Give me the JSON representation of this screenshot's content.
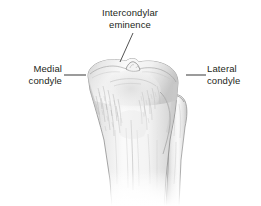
{
  "figure": {
    "background_color": "#ffffff",
    "width": 261,
    "height": 206
  },
  "labels": {
    "intercondylar_eminence": "Intercondylar\neminence",
    "medial_condyle": "Medial\ncondyle",
    "lateral_condyle": "Lateral\ncondyle"
  },
  "leader_lines": {
    "intercondylar": {
      "x1": 133,
      "y1": 33,
      "x2": 120,
      "y2": 62,
      "color": "#3f3f3f"
    },
    "medial": {
      "x1": 64,
      "y1": 75,
      "x2": 86,
      "y2": 75,
      "color": "#4a4a4a"
    },
    "lateral": {
      "x1": 186,
      "y1": 75,
      "x2": 206,
      "y2": 75,
      "color": "#4a4a4a"
    }
  },
  "colors": {
    "bone_fill_light": "#fbfbfb",
    "bone_fill_mid": "#ededed",
    "bone_fill_shadow": "#d2d2d2",
    "bone_outline": "#8a8a8a",
    "bone_outline_dark": "#6e6e6e",
    "texture_line": "#b4b4b4",
    "text": "#231f20"
  },
  "structures": [
    {
      "name": "tibial-plateau",
      "description": "Broad superior articular surface of the tibia"
    },
    {
      "name": "intercondylar-eminence",
      "description": "Small central bony peak on the tibial plateau"
    },
    {
      "name": "medial-condyle",
      "description": "Left-side condyle of the proximal tibia"
    },
    {
      "name": "lateral-condyle",
      "description": "Right-side condyle of the proximal tibia"
    },
    {
      "name": "tibial-shaft",
      "description": "Tapering diaphysis of the tibia fading at the lower crop edge"
    },
    {
      "name": "fibula",
      "description": "Slender lateral bone with an expanded head beneath the lateral condyle"
    }
  ]
}
